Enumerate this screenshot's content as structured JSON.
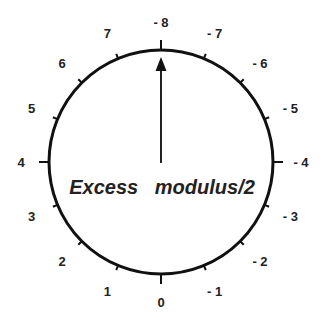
{
  "diagram": {
    "caption": "Excess   modulus/2",
    "divisions": 16,
    "pointer_value": "- 8",
    "left_labels": [
      "0",
      "1",
      "2",
      "3",
      "4",
      "5",
      "6",
      "7"
    ],
    "top_label": "- 8",
    "right_labels": [
      "- 1",
      "- 2",
      "- 3",
      "- 4",
      "- 5",
      "- 6",
      "- 7"
    ],
    "colors": {
      "line": "#111111",
      "text": "#222222",
      "background": "#ffffff"
    }
  }
}
